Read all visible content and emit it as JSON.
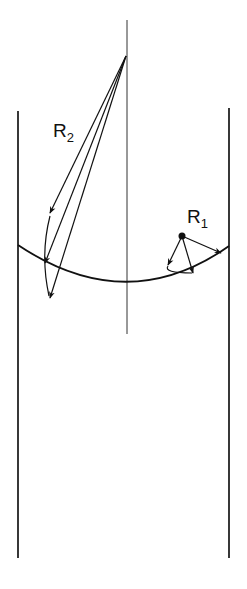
{
  "diagram": {
    "colors": {
      "ink": "#111111",
      "background": "#ffffff"
    },
    "labels": {
      "r2": {
        "main": "R",
        "sub": "2"
      },
      "r1": {
        "main": "R",
        "sub": "1"
      }
    },
    "elements": [
      "left-wall",
      "right-wall",
      "center-axis",
      "meniscus-surface",
      "r2-radius-vectors",
      "r1-radius-vectors"
    ]
  }
}
